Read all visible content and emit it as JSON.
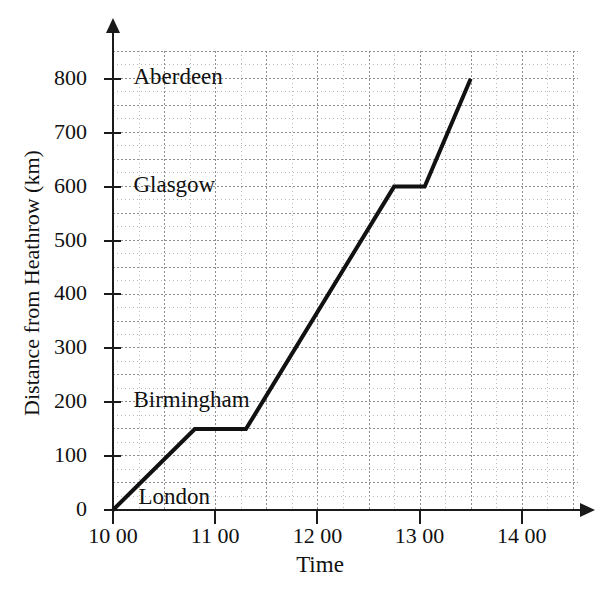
{
  "chart_data": {
    "type": "line",
    "title": "",
    "xlabel": "Time",
    "ylabel": "Distance from Heathrow (km)",
    "xlim": [
      10,
      14.6
    ],
    "ylim": [
      0,
      850
    ],
    "grid": true,
    "legend": "none",
    "x_tick_labels": [
      "10 00",
      "11 00",
      "12 00",
      "13 00",
      "14 00"
    ],
    "x_tick_values": [
      10,
      11,
      12,
      13,
      14
    ],
    "y_tick_labels": [
      "0",
      "100",
      "200",
      "300",
      "400",
      "500",
      "600",
      "700",
      "800"
    ],
    "y_tick_values": [
      0,
      100,
      200,
      300,
      400,
      500,
      600,
      700,
      800
    ],
    "minor_grid_x_step": 0.25,
    "minor_grid_y_step": 25,
    "series": [
      {
        "name": "Journey from Heathrow",
        "x": [
          10.0,
          10.8,
          11.3,
          12.75,
          13.05,
          13.5
        ],
        "y": [
          0,
          150,
          150,
          600,
          600,
          800
        ],
        "time_labels": [
          "10 00",
          "10 48",
          "11 18",
          "12 45",
          "13 03",
          "13 30"
        ]
      }
    ],
    "annotations": [
      {
        "text": "Aberdeen",
        "x": 10.2,
        "y": 800
      },
      {
        "text": "Glasgow",
        "x": 10.2,
        "y": 600
      },
      {
        "text": "Birmingham",
        "x": 10.2,
        "y": 200
      },
      {
        "text": "London",
        "x": 10.25,
        "y": 20
      }
    ]
  },
  "axes": {
    "y_title": "Distance from Heathrow (km)",
    "x_title": "Time"
  }
}
